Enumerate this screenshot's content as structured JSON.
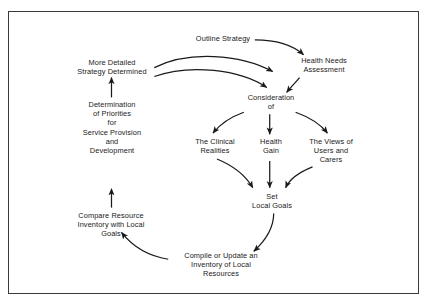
{
  "diagram": {
    "type": "cyclical-flowchart",
    "border_color": "#3a3a3a",
    "background_color": "#ffffff",
    "text_color": "#1a1a1a",
    "arrow_color": "#1a1a1a",
    "nodes": [
      {
        "id": "outline_strategy",
        "label": "Outline Strategy"
      },
      {
        "id": "health_needs",
        "label": "Health Needs\nAssessment"
      },
      {
        "id": "more_detailed",
        "label": "More Detailed\nStrategy Determined"
      },
      {
        "id": "consideration",
        "label": "Consideration\nof"
      },
      {
        "id": "determination",
        "label": "Determination\nof Priorities\nfor\nService Provision\nand\nDevelopment"
      },
      {
        "id": "clinical_realities",
        "label": "The Clinical\nRealities"
      },
      {
        "id": "health_gain",
        "label": "Health\nGain"
      },
      {
        "id": "views_users",
        "label": "The Views of\nUsers and\nCarers"
      },
      {
        "id": "set_local_goals",
        "label": "Set\nLocal Goals"
      },
      {
        "id": "compare_resource",
        "label": "Compare Resource\nInventory with Local\nGoals"
      },
      {
        "id": "compile_update",
        "label": "Compile or Update an\nInventory of Local\nResources"
      }
    ],
    "edges": [
      {
        "from": "outline_strategy",
        "to": "health_needs",
        "style": "curved"
      },
      {
        "from": "health_needs",
        "to": "consideration",
        "style": "straight-diagonal"
      },
      {
        "from": "more_detailed",
        "to": "health_needs",
        "style": "curved"
      },
      {
        "from": "more_detailed",
        "to": "consideration",
        "style": "curved"
      },
      {
        "from": "consideration",
        "to": "clinical_realities",
        "style": "curved"
      },
      {
        "from": "consideration",
        "to": "health_gain",
        "style": "straight-vertical"
      },
      {
        "from": "consideration",
        "to": "views_users",
        "style": "curved"
      },
      {
        "from": "clinical_realities",
        "to": "set_local_goals",
        "style": "curved"
      },
      {
        "from": "health_gain",
        "to": "set_local_goals",
        "style": "straight-vertical"
      },
      {
        "from": "views_users",
        "to": "set_local_goals",
        "style": "curved"
      },
      {
        "from": "set_local_goals",
        "to": "compile_update",
        "style": "curved"
      },
      {
        "from": "compile_update",
        "to": "compare_resource",
        "style": "curved"
      },
      {
        "from": "compare_resource",
        "to": "determination",
        "style": "straight-vertical"
      },
      {
        "from": "determination",
        "to": "more_detailed",
        "style": "straight-vertical"
      }
    ]
  }
}
